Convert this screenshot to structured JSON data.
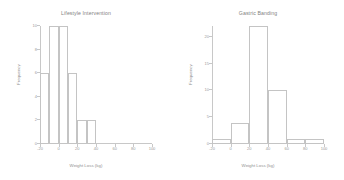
{
  "figure": {
    "background": "#ffffff",
    "axis_color": "#c8c8c8",
    "bar_edge_color": "#c4c4c4",
    "bar_fill_color": "#ffffff"
  },
  "chart_data": [
    {
      "type": "bar",
      "panel": "left",
      "title": "Lifestyle Intervention",
      "xlabel": "Weight Loss (kg)",
      "ylabel": "Frequency",
      "grid": false,
      "legend": "none",
      "xlim": [
        -20,
        100
      ],
      "ylim": [
        0,
        10
      ],
      "xticks": [
        -20,
        0,
        20,
        40,
        60,
        80,
        100
      ],
      "xtick_labels": [
        "-20",
        "0",
        "20",
        "40",
        "60",
        "80",
        "100"
      ],
      "yticks": [
        0,
        2,
        4,
        6,
        8,
        10
      ],
      "ytick_labels": [
        "0",
        "2",
        "4",
        "6",
        "8",
        "10"
      ],
      "bin_width": 10,
      "bin_edges": [
        -20,
        -10,
        0,
        10,
        20,
        30,
        40
      ],
      "categories": [
        "-20 to -10",
        "-10 to 0",
        "0 to 10",
        "10 to 20",
        "20 to 30",
        "30 to 40"
      ],
      "values": [
        6,
        10,
        10,
        6,
        2,
        2
      ]
    },
    {
      "type": "bar",
      "panel": "right",
      "title": "Gastric Banding",
      "xlabel": "Weight Loss (kg)",
      "ylabel": "Frequency",
      "grid": false,
      "legend": "none",
      "xlim": [
        -20,
        100
      ],
      "ylim": [
        0,
        22
      ],
      "xticks": [
        -20,
        0,
        20,
        40,
        60,
        80,
        100
      ],
      "xtick_labels": [
        "-20",
        "0",
        "20",
        "40",
        "60",
        "80",
        "100"
      ],
      "yticks": [
        0,
        5,
        10,
        15,
        20
      ],
      "ytick_labels": [
        "0",
        "5",
        "10",
        "15",
        "20"
      ],
      "bin_width": 20,
      "bin_edges": [
        -20,
        0,
        20,
        40,
        60,
        80,
        100
      ],
      "categories": [
        "-20 to 0",
        "0 to 20",
        "20 to 40",
        "40 to 60",
        "60 to 80",
        "80 to 100"
      ],
      "values": [
        1,
        4,
        22,
        10,
        1,
        1
      ]
    }
  ]
}
